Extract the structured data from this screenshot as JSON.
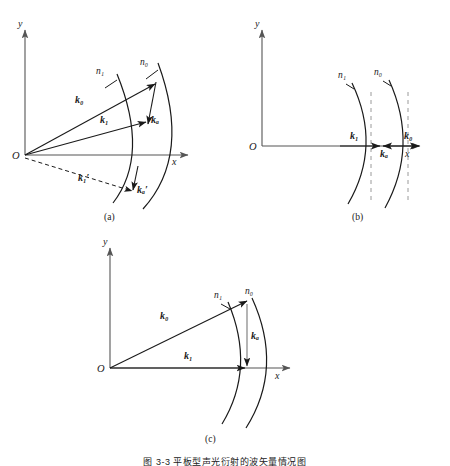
{
  "figure": {
    "caption_cn": "图 3-3  平板型声光衍射的波矢量情况图",
    "axis": {
      "x_label": "x",
      "y_label": "y",
      "origin_label": "O"
    },
    "panels": [
      {
        "id": "a",
        "caption": "(a)",
        "arcs": [
          {
            "name": "arc-n1",
            "label": "n₁"
          },
          {
            "name": "arc-n0",
            "label": "n₀"
          }
        ],
        "vectors": [
          {
            "name": "k0",
            "label": "k₀",
            "style": "solid",
            "direction": "up-right"
          },
          {
            "name": "k1",
            "label": "k₁",
            "style": "solid",
            "direction": "right-slight-up"
          },
          {
            "name": "ka",
            "label": "kₐ",
            "style": "solid",
            "direction": "down"
          },
          {
            "name": "k1-prime",
            "label": "k₁′",
            "style": "dashed",
            "direction": "down-right"
          },
          {
            "name": "ka-prime",
            "label": "kₐ′",
            "style": "solid",
            "direction": "down"
          }
        ]
      },
      {
        "id": "b",
        "caption": "(b)",
        "arcs": [
          {
            "name": "arc-n1",
            "label": "n₁"
          },
          {
            "name": "arc-n0",
            "label": "n₀"
          }
        ],
        "vectors": [
          {
            "name": "k1",
            "label": "k₁",
            "style": "solid",
            "direction": "right"
          },
          {
            "name": "ka",
            "label": "kₐ",
            "style": "solid",
            "direction": "left"
          },
          {
            "name": "k0",
            "label": "k₀",
            "style": "solid",
            "direction": "right"
          }
        ],
        "guides": [
          {
            "name": "dashed-guide-left",
            "style": "dashed-vertical"
          },
          {
            "name": "dashed-guide-right",
            "style": "dashed-vertical"
          }
        ]
      },
      {
        "id": "c",
        "caption": "(c)",
        "arcs": [
          {
            "name": "arc-n1",
            "label": "n₁"
          },
          {
            "name": "arc-n0",
            "label": "n₀"
          }
        ],
        "vectors": [
          {
            "name": "k0",
            "label": "k₀",
            "style": "solid",
            "direction": "up-right"
          },
          {
            "name": "k1",
            "label": "k₁",
            "style": "solid",
            "direction": "right"
          },
          {
            "name": "ka",
            "label": "kₐ",
            "style": "solid",
            "direction": "down"
          }
        ]
      }
    ],
    "colors": {
      "stroke": "#1a1a1a",
      "axis": "#555555",
      "dashed_guide": "#9a9a9a",
      "background": "#ffffff"
    }
  }
}
